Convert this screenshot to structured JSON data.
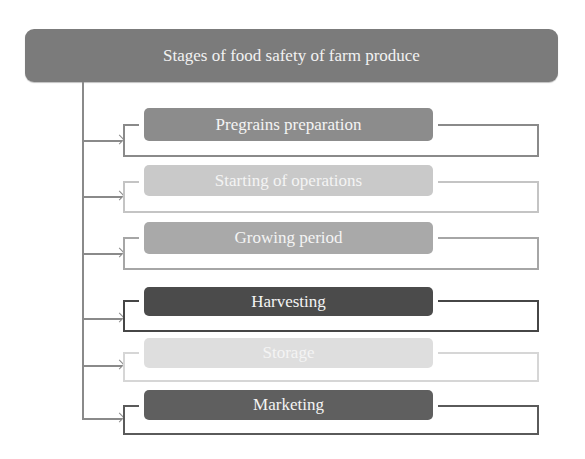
{
  "title": "Stages of food safety of farm produce",
  "colors": {
    "header_bg": "#7b7b7b",
    "trunk": "#8a8a8a"
  },
  "stages": [
    {
      "label": "Pregrains preparation",
      "box_color": "#8c8c8c",
      "line_color": "#8a8a8a",
      "box_top": 108,
      "box_bottom": 141,
      "bracket_top": 124,
      "bracket_bottom": 155,
      "arrow_y": 140
    },
    {
      "label": "Starting of operations",
      "box_color": "#c9c9c9",
      "line_color": "#c4c4c4",
      "box_top": 165,
      "box_bottom": 196,
      "bracket_top": 181,
      "bracket_bottom": 211,
      "arrow_y": 196
    },
    {
      "label": "Growing period",
      "box_color": "#a9a9a9",
      "line_color": "#a6a6a6",
      "box_top": 222,
      "box_bottom": 254,
      "bracket_top": 237,
      "bracket_bottom": 268,
      "arrow_y": 253
    },
    {
      "label": "Harvesting",
      "box_color": "#4b4b4b",
      "line_color": "#464646",
      "box_top": 287,
      "box_bottom": 316,
      "bracket_top": 300,
      "bracket_bottom": 330,
      "arrow_y": 318
    },
    {
      "label": "Storage",
      "box_color": "#dedede",
      "line_color": "#d6d6d6",
      "box_top": 338,
      "box_bottom": 368,
      "bracket_top": 352,
      "bracket_bottom": 380,
      "arrow_y": 365
    },
    {
      "label": "Marketing",
      "box_color": "#5f5f5f",
      "line_color": "#5a5a5a",
      "box_top": 390,
      "box_bottom": 420,
      "bracket_top": 405,
      "bracket_bottom": 433,
      "arrow_y": 418
    }
  ]
}
